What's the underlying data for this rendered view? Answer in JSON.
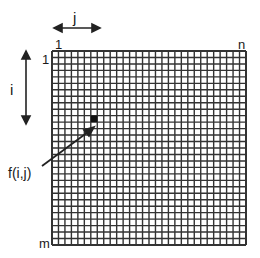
{
  "diagram": {
    "type": "matrix-grid",
    "labels": {
      "col_axis": "j",
      "row_axis": "i",
      "first_col": "1",
      "last_col": "n",
      "first_row": "1",
      "last_row": "m",
      "element": "f(i,j)"
    },
    "grid": {
      "rows": 30,
      "cols": 30,
      "highlighted_cell": {
        "row": 11,
        "col": 7
      }
    },
    "colors": {
      "line": "#333333",
      "background": "#ffffff",
      "highlight": "#111111"
    }
  }
}
